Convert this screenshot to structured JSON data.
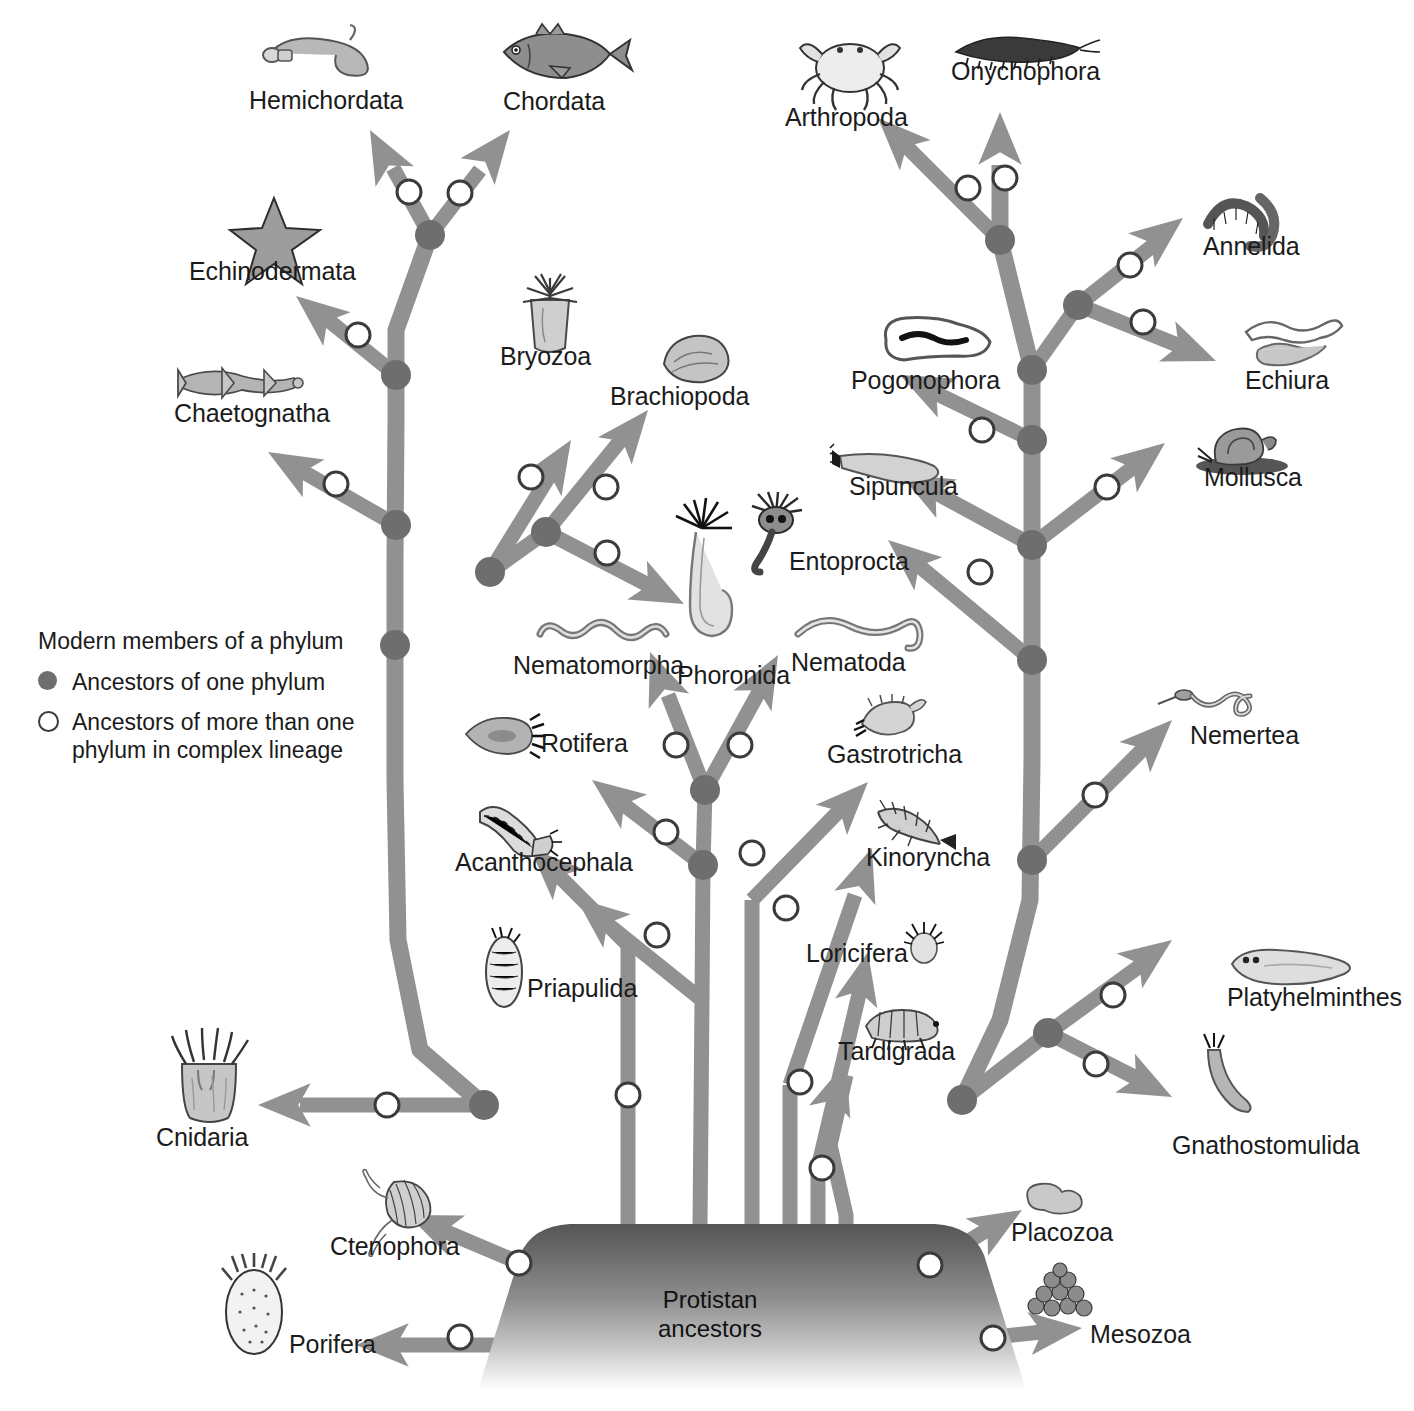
{
  "diagram": {
    "root_label_line1": "Protistan",
    "root_label_line2": "ancestors",
    "branch_color": "#919191",
    "node_filled_color": "#6e6e6e",
    "node_open_stroke": "#3b3b3b",
    "background": "#ffffff"
  },
  "legend": {
    "title": "Modern members of a phylum",
    "items": [
      {
        "marker": "filled-circle",
        "label": "Ancestors of one phylum"
      },
      {
        "marker": "open-circle",
        "label": "Ancestors of more than one\nphylum in complex lineage"
      }
    ],
    "item_filled_label": "Ancestors of one phylum",
    "item_open_label_line1": "Ancestors of more than one",
    "item_open_label_line2": "phylum in complex lineage"
  },
  "phyla": [
    {
      "name": "Hemichordata",
      "x": 249,
      "y": 86,
      "icon": "acorn-worm-icon"
    },
    {
      "name": "Chordata",
      "x": 503,
      "y": 87,
      "icon": "fish-icon"
    },
    {
      "name": "Arthropoda",
      "x": 785,
      "y": 103,
      "icon": "crab-icon"
    },
    {
      "name": "Onychophora",
      "x": 951,
      "y": 57,
      "icon": "velvet-worm-icon"
    },
    {
      "name": "Echinodermata",
      "x": 189,
      "y": 257,
      "icon": "sea-star-icon"
    },
    {
      "name": "Annelida",
      "x": 1203,
      "y": 232,
      "icon": "segmented-worm-icon"
    },
    {
      "name": "Bryozoa",
      "x": 500,
      "y": 342,
      "icon": "bryozoan-icon"
    },
    {
      "name": "Brachiopoda",
      "x": 610,
      "y": 382,
      "icon": "lamp-shell-icon"
    },
    {
      "name": "Pogonophora",
      "x": 851,
      "y": 366,
      "icon": "beard-worm-icon"
    },
    {
      "name": "Echiura",
      "x": 1245,
      "y": 366,
      "icon": "spoon-worm-icon"
    },
    {
      "name": "Chaetognatha",
      "x": 174,
      "y": 399,
      "icon": "arrow-worm-icon"
    },
    {
      "name": "Sipuncula",
      "x": 849,
      "y": 472,
      "icon": "peanut-worm-icon"
    },
    {
      "name": "Mollusca",
      "x": 1204,
      "y": 463,
      "icon": "snail-icon"
    },
    {
      "name": "Entoprocta",
      "x": 789,
      "y": 547,
      "icon": "entoproct-icon"
    },
    {
      "name": "Nematomorpha",
      "x": 513,
      "y": 651,
      "icon": "horsehair-worm-icon"
    },
    {
      "name": "Phoronida",
      "x": 677,
      "y": 661,
      "icon": "horseshoe-worm-icon"
    },
    {
      "name": "Nematoda",
      "x": 791,
      "y": 648,
      "icon": "roundworm-icon"
    },
    {
      "name": "Gastrotricha",
      "x": 827,
      "y": 740,
      "icon": "gastrotrich-icon"
    },
    {
      "name": "Nemertea",
      "x": 1190,
      "y": 721,
      "icon": "ribbon-worm-icon"
    },
    {
      "name": "Rotifera",
      "x": 541,
      "y": 729,
      "icon": "rotifer-icon"
    },
    {
      "name": "Kinorhyncha",
      "x": 866,
      "y": 843,
      "icon": "mud-dragon-icon"
    },
    {
      "name": "Acanthocephala",
      "x": 455,
      "y": 848,
      "icon": "thorny-headed-worm-icon"
    },
    {
      "name": "Loricifera",
      "x": 806,
      "y": 939,
      "icon": "loriciferan-icon"
    },
    {
      "name": "Priapulida",
      "x": 527,
      "y": 974,
      "icon": "penis-worm-icon"
    },
    {
      "name": "Platyhelminthes",
      "x": 1227,
      "y": 983,
      "icon": "flatworm-icon"
    },
    {
      "name": "Tardigrada",
      "x": 838,
      "y": 1037,
      "icon": "water-bear-icon"
    },
    {
      "name": "Gnathostomulida",
      "x": 1172,
      "y": 1131,
      "icon": "jaw-worm-icon"
    },
    {
      "name": "Cnidaria",
      "x": 156,
      "y": 1123,
      "icon": "sea-anemone-icon"
    },
    {
      "name": "Placozoa",
      "x": 1011,
      "y": 1218,
      "icon": "placozoan-icon"
    },
    {
      "name": "Ctenophora",
      "x": 330,
      "y": 1232,
      "icon": "comb-jelly-icon"
    },
    {
      "name": "Mesozoa",
      "x": 1090,
      "y": 1320,
      "icon": "mesozoan-icon"
    },
    {
      "name": "Porifera",
      "x": 289,
      "y": 1330,
      "icon": "sponge-icon"
    }
  ],
  "display_label_kinorhyncha": "Kinoryncha"
}
